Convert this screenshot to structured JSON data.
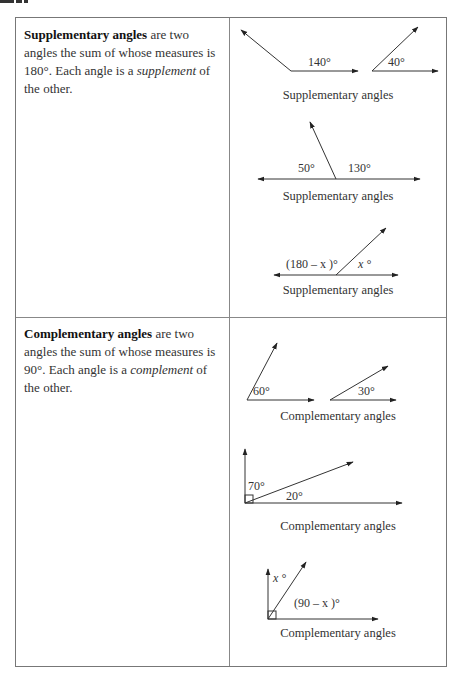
{
  "supplementary": {
    "term": "Supplementary angles",
    "definition_rest_1": " are two angles the sum of whose measures is 180°. Each angle is a ",
    "emphasis": "supplement",
    "definition_rest_2": " of the other.",
    "figures": [
      {
        "labels": [
          "140°",
          "40°"
        ],
        "caption": "Supplementary angles"
      },
      {
        "labels": [
          "50°",
          "130°"
        ],
        "caption": "Supplementary angles"
      },
      {
        "labels": [
          "(180 – x )°",
          "x °"
        ],
        "caption": "Supplementary angles"
      }
    ]
  },
  "complementary": {
    "term": "Complementary angles",
    "definition_rest_1": " are two angles the sum of whose measures is 90°. Each angle is a ",
    "emphasis": "complement",
    "definition_rest_2": " of the other.",
    "figures": [
      {
        "labels": [
          "60°",
          "30°"
        ],
        "caption": "Complementary angles"
      },
      {
        "labels": [
          "70°",
          "20°"
        ],
        "caption": "Complementary angles"
      },
      {
        "labels": [
          "x °",
          "(90 – x )°"
        ],
        "caption": "Complementary angles"
      }
    ]
  }
}
